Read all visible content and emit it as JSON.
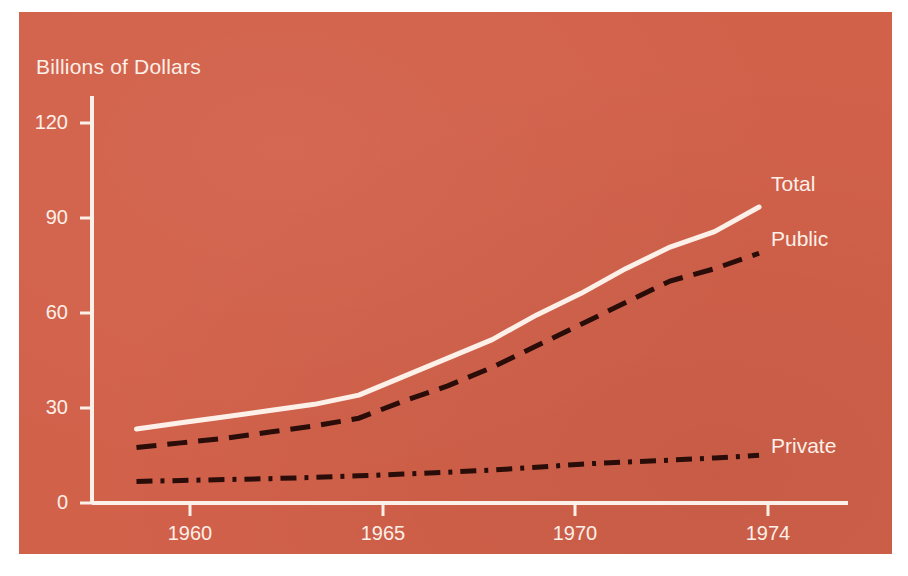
{
  "figure": {
    "background_color": "#ffffff",
    "panel_color": "#d2614a",
    "ink_color": "#fdf0e8",
    "dark_ink_color": "#2a0d08"
  },
  "chart_data": {
    "type": "line",
    "title": "",
    "subtitle": "",
    "xlabel": "",
    "ylabel": "Billions of Dollars",
    "grid": false,
    "legend_position": "right-inline-labels",
    "xlim": [
      1959,
      1976
    ],
    "ylim": [
      0,
      132
    ],
    "x_tick_labels": [
      "1960",
      "1965",
      "1970",
      "1974"
    ],
    "x_tick_values": [
      1960,
      1965,
      1970,
      1974
    ],
    "y_tick_labels": [
      "0",
      "30",
      "60",
      "90",
      "120"
    ],
    "y_tick_values": [
      0,
      30,
      60,
      90,
      120
    ],
    "x": [
      1960,
      1961,
      1962,
      1963,
      1964,
      1965,
      1966,
      1967,
      1968,
      1969,
      1970,
      1971,
      1972,
      1973,
      1974
    ],
    "series": [
      {
        "name": "Total",
        "label": "Total",
        "style": "solid",
        "color": "#fdf0e8",
        "values": [
          24,
          26,
          28,
          30,
          32,
          35,
          41,
          47,
          53,
          61,
          68,
          76,
          83,
          88,
          96
        ]
      },
      {
        "name": "Public",
        "label": "Public",
        "style": "dashed",
        "color": "#2a0d08",
        "values": [
          18,
          19.5,
          21,
          23,
          25,
          27.5,
          33,
          38,
          44,
          51,
          58,
          65,
          72,
          76,
          81
        ]
      },
      {
        "name": "Private",
        "label": "Private",
        "style": "dashdot",
        "color": "#2a0d08",
        "values": [
          7,
          7.3,
          7.6,
          7.9,
          8.3,
          8.8,
          9.4,
          10,
          10.7,
          11.6,
          12.6,
          13.3,
          13.9,
          14.6,
          15.5
        ]
      }
    ]
  }
}
